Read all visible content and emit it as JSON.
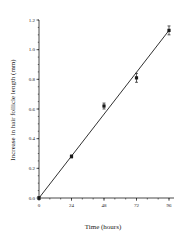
{
  "chart_data": {
    "type": "scatter",
    "title": "",
    "xlabel": "Time (hours)",
    "ylabel": "Increase in hair follicle length  (mm)",
    "xlim": [
      0,
      100
    ],
    "ylim": [
      0,
      1.2
    ],
    "xticks": [
      0,
      24,
      48,
      72,
      96
    ],
    "xtick_labels": [
      "0",
      "24",
      "48",
      "72",
      "96"
    ],
    "x_minor_step": 8,
    "yticks": [
      0.0,
      0.2,
      0.4,
      0.6,
      0.8,
      1.0,
      1.2
    ],
    "ytick_labels": [
      "0.0",
      "0.2",
      "0.4",
      "0.6",
      "0.8",
      "1.0",
      "1.2"
    ],
    "y_minor_step": 0.05,
    "grid": false,
    "legend": null,
    "series": [
      {
        "name": "Hair follicle growth",
        "marker": "square",
        "x": [
          0,
          24,
          48,
          72,
          96
        ],
        "y": [
          0.0,
          0.28,
          0.62,
          0.81,
          1.13
        ],
        "yerr": [
          0.01,
          0.01,
          0.02,
          0.03,
          0.03
        ]
      }
    ],
    "fit_line": {
      "type": "linear",
      "x": [
        0,
        96
      ],
      "y": [
        0.0,
        1.13
      ]
    }
  },
  "colors": {
    "ink": "#1a1a1a",
    "background": "#ffffff"
  }
}
